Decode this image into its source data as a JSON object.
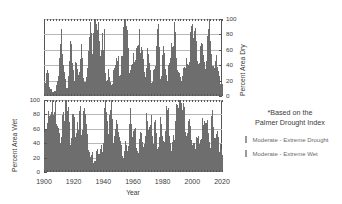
{
  "chart_data": [
    {
      "type": "bar",
      "id": "percent-area-dry",
      "title": "",
      "xlabel": "Year",
      "ylabel": "Percent Area Dry",
      "ylim": [
        0,
        100
      ],
      "xlim": [
        1900,
        2020
      ],
      "yticks": [
        0,
        20,
        40,
        60,
        80,
        100
      ],
      "xticks": [
        1900,
        1920,
        1940,
        1960,
        1980,
        2000,
        2020
      ],
      "grid": true,
      "y_axis_side": "right",
      "series_color": "#6e6e6e",
      "x": [
        1900,
        1901,
        1902,
        1903,
        1904,
        1905,
        1906,
        1907,
        1908,
        1909,
        1910,
        1911,
        1912,
        1913,
        1914,
        1915,
        1916,
        1917,
        1918,
        1919,
        1920,
        1921,
        1922,
        1923,
        1924,
        1925,
        1926,
        1927,
        1928,
        1929,
        1930,
        1931,
        1932,
        1933,
        1934,
        1935,
        1936,
        1937,
        1938,
        1939,
        1940,
        1941,
        1942,
        1943,
        1944,
        1945,
        1946,
        1947,
        1948,
        1949,
        1950,
        1951,
        1952,
        1953,
        1954,
        1955,
        1956,
        1957,
        1958,
        1959,
        1960,
        1961,
        1962,
        1963,
        1964,
        1965,
        1966,
        1967,
        1968,
        1969,
        1970,
        1971,
        1972,
        1973,
        1974,
        1975,
        1976,
        1977,
        1978,
        1979,
        1980,
        1981,
        1982,
        1983,
        1984,
        1985,
        1986,
        1987,
        1988,
        1989,
        1990,
        1991,
        1992,
        1993,
        1994,
        1995,
        1996,
        1997,
        1998,
        1999,
        2000,
        2001,
        2002,
        2003,
        2004,
        2005,
        2006,
        2007,
        2008,
        2009,
        2010,
        2011,
        2012,
        2013,
        2014,
        2015,
        2016,
        2017,
        2018,
        2019,
        2020
      ],
      "values": [
        12,
        30,
        22,
        8,
        6,
        4,
        3,
        5,
        12,
        18,
        40,
        72,
        30,
        26,
        12,
        5,
        18,
        46,
        54,
        30,
        10,
        35,
        28,
        20,
        34,
        48,
        22,
        10,
        18,
        30,
        55,
        68,
        40,
        62,
        96,
        72,
        80,
        50,
        30,
        60,
        66,
        20,
        8,
        26,
        16,
        10,
        12,
        28,
        32,
        44,
        30,
        22,
        36,
        58,
        76,
        70,
        62,
        18,
        22,
        30,
        38,
        30,
        42,
        56,
        66,
        40,
        48,
        30,
        20,
        26,
        44,
        30,
        16,
        12,
        30,
        22,
        60,
        68,
        34,
        18,
        42,
        46,
        24,
        14,
        30,
        40,
        52,
        36,
        74,
        40,
        26,
        18,
        22,
        14,
        30,
        24,
        40,
        22,
        30,
        56,
        72,
        48,
        68,
        40,
        24,
        34,
        62,
        50,
        36,
        22,
        42,
        60,
        86,
        44,
        30,
        26,
        40,
        30,
        22,
        18,
        14
      ],
      "values_note": "Monthly resolution data rendered as dense vertical bars; annual values listed are representative peaks."
    },
    {
      "type": "bar",
      "id": "percent-area-wet",
      "title": "",
      "xlabel": "Year",
      "ylabel": "Percent Area Wet",
      "ylim": [
        0,
        100
      ],
      "xlim": [
        1900,
        2020
      ],
      "yticks": [
        0,
        20,
        40,
        60,
        80,
        100
      ],
      "xticks": [
        1900,
        1920,
        1940,
        1960,
        1980,
        2000,
        2020
      ],
      "grid": true,
      "y_axis_side": "left",
      "series_color": "#6e6e6e",
      "x": [
        1900,
        1901,
        1902,
        1903,
        1904,
        1905,
        1906,
        1907,
        1908,
        1909,
        1910,
        1911,
        1912,
        1913,
        1914,
        1915,
        1916,
        1917,
        1918,
        1919,
        1920,
        1921,
        1922,
        1923,
        1924,
        1925,
        1926,
        1927,
        1928,
        1929,
        1930,
        1931,
        1932,
        1933,
        1934,
        1935,
        1936,
        1937,
        1938,
        1939,
        1940,
        1941,
        1942,
        1943,
        1944,
        1945,
        1946,
        1947,
        1948,
        1949,
        1950,
        1951,
        1952,
        1953,
        1954,
        1955,
        1956,
        1957,
        1958,
        1959,
        1960,
        1961,
        1962,
        1963,
        1964,
        1965,
        1966,
        1967,
        1968,
        1969,
        1970,
        1971,
        1972,
        1973,
        1974,
        1975,
        1976,
        1977,
        1978,
        1979,
        1980,
        1981,
        1982,
        1983,
        1984,
        1985,
        1986,
        1987,
        1988,
        1989,
        1990,
        1991,
        1992,
        1993,
        1994,
        1995,
        1996,
        1997,
        1998,
        1999,
        2000,
        2001,
        2002,
        2003,
        2004,
        2005,
        2006,
        2007,
        2008,
        2009,
        2010,
        2011,
        2012,
        2013,
        2014,
        2015,
        2016,
        2017,
        2018,
        2019,
        2020
      ],
      "values": [
        46,
        40,
        70,
        62,
        48,
        76,
        56,
        74,
        40,
        52,
        30,
        26,
        62,
        48,
        92,
        58,
        68,
        34,
        22,
        72,
        50,
        30,
        60,
        40,
        74,
        36,
        56,
        66,
        44,
        34,
        20,
        14,
        22,
        12,
        8,
        18,
        24,
        16,
        30,
        20,
        34,
        92,
        60,
        36,
        56,
        70,
        46,
        30,
        44,
        58,
        40,
        30,
        26,
        14,
        20,
        34,
        18,
        42,
        64,
        44,
        38,
        50,
        30,
        20,
        26,
        44,
        30,
        22,
        36,
        60,
        50,
        40,
        62,
        44,
        30,
        58,
        34,
        24,
        40,
        56,
        30,
        36,
        44,
        72,
        52,
        30,
        24,
        40,
        30,
        60,
        78,
        50,
        84,
        66,
        74,
        46,
        30,
        40,
        56,
        44,
        26,
        30,
        20,
        34,
        42,
        26,
        38,
        52,
        60,
        44,
        56,
        38,
        24,
        50,
        66,
        40,
        30,
        44,
        36,
        28,
        22
      ],
      "values_note": "Monthly resolution data rendered as dense vertical bars; annual values listed are representative peaks."
    }
  ],
  "axes": {
    "dry": {
      "title": "Percent Area Dry",
      "ticks": [
        "0",
        "20",
        "40",
        "60",
        "80",
        "100"
      ]
    },
    "wet": {
      "title": "Percent Area Wet",
      "ticks": [
        "0",
        "20",
        "40",
        "60",
        "80",
        "100"
      ]
    },
    "x": {
      "title": "Year",
      "ticks": [
        "1900",
        "1920",
        "1940",
        "1960",
        "1980",
        "2000",
        "2020"
      ]
    }
  },
  "sidenote": {
    "line1": "*Based on the",
    "line2": "Palmer Drought Index",
    "legend": [
      {
        "label": "Moderate - Extreme Drought",
        "color": "#9a9a9a"
      },
      {
        "label": "Moderate - Extreme Wet",
        "color": "#9a9a9a"
      }
    ]
  },
  "colors": {
    "bar": "#6e6e6e",
    "grid": "#b8b8b8",
    "frame": "#555555",
    "text": "#3a3a3a"
  }
}
